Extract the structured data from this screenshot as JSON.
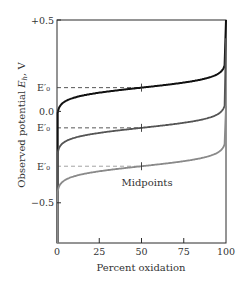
{
  "chart_data": {
    "type": "line",
    "title": "",
    "xlabel": "Percent oxidation",
    "ylabel": "Observed potential E_h, V",
    "ylabel_parts": {
      "main": "Observed potential ",
      "italic": "E",
      "sub": "h",
      "unit": ", V"
    },
    "xlim": [
      0,
      100
    ],
    "ylim": [
      -0.72,
      0.5
    ],
    "x_ticks": [
      0,
      25,
      50,
      75,
      100
    ],
    "x_tick_labels": [
      "0",
      "25",
      "50",
      "75",
      "100"
    ],
    "y_ticks": [
      0.5,
      0.0,
      -0.5
    ],
    "y_tick_labels": [
      "+0.5",
      "0.0",
      "−0.5"
    ],
    "e0_labels": [
      "E′₀",
      "E′₀",
      "E′₀"
    ],
    "grid": false,
    "legend": null,
    "annotations": [
      {
        "text": "Midpoints",
        "x": 50,
        "y": -0.4
      }
    ],
    "series": [
      {
        "name": "Redox pair 1",
        "E0": 0.13,
        "color": "#111111",
        "x": [
          0.5,
          5,
          10,
          25,
          50,
          75,
          90,
          95,
          100
        ],
        "values": [
          -0.72,
          -0.14,
          -0.05,
          0.06,
          0.13,
          0.2,
          0.31,
          0.4,
          0.5
        ]
      },
      {
        "name": "Redox pair 2",
        "E0": -0.09,
        "color": "#555555",
        "x": [
          0.5,
          5,
          10,
          25,
          50,
          75,
          90,
          95,
          100
        ],
        "values": [
          -0.72,
          -0.36,
          -0.27,
          -0.16,
          -0.09,
          -0.02,
          0.09,
          0.18,
          0.4
        ]
      },
      {
        "name": "Redox pair 3",
        "E0": -0.3,
        "color": "#8a8a8a",
        "x": [
          0,
          5,
          10,
          25,
          50,
          75,
          90,
          95,
          100
        ],
        "values": [
          -0.72,
          -0.57,
          -0.48,
          -0.37,
          -0.3,
          -0.23,
          -0.12,
          -0.03,
          0.03
        ]
      }
    ]
  }
}
